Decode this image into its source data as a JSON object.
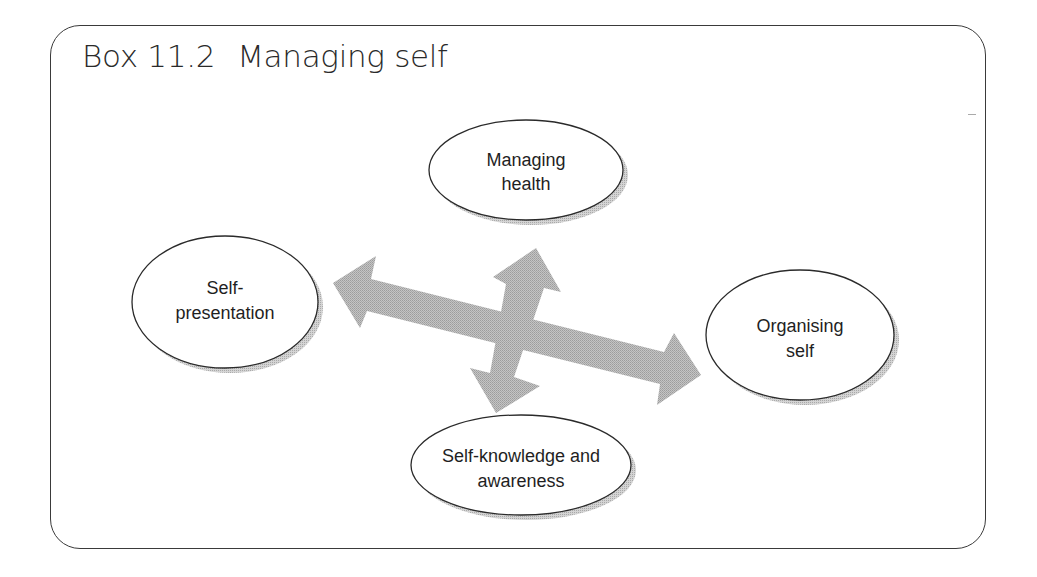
{
  "box": {
    "number": "Box 11.2",
    "title": "Managing self"
  },
  "diagram": {
    "arrow_color": "#b4b4b4",
    "ellipse_stroke": "#2a2a2a",
    "shadow_color": "#bdbdbd",
    "nodes": [
      {
        "id": "managing-health",
        "lines": [
          "Managing",
          "health"
        ],
        "position": "top"
      },
      {
        "id": "self-presentation",
        "lines": [
          "Self-",
          "presentation"
        ],
        "position": "left"
      },
      {
        "id": "organising-self",
        "lines": [
          "Organising",
          "self"
        ],
        "position": "right"
      },
      {
        "id": "self-knowledge",
        "lines": [
          "Self-knowledge and",
          "awareness"
        ],
        "position": "bottom"
      }
    ],
    "arrows": [
      {
        "id": "horizontal",
        "from": "self-presentation",
        "to": "organising-self",
        "bidirectional": true
      },
      {
        "id": "vertical",
        "from": "managing-health",
        "to": "self-knowledge",
        "bidirectional": true
      }
    ]
  }
}
